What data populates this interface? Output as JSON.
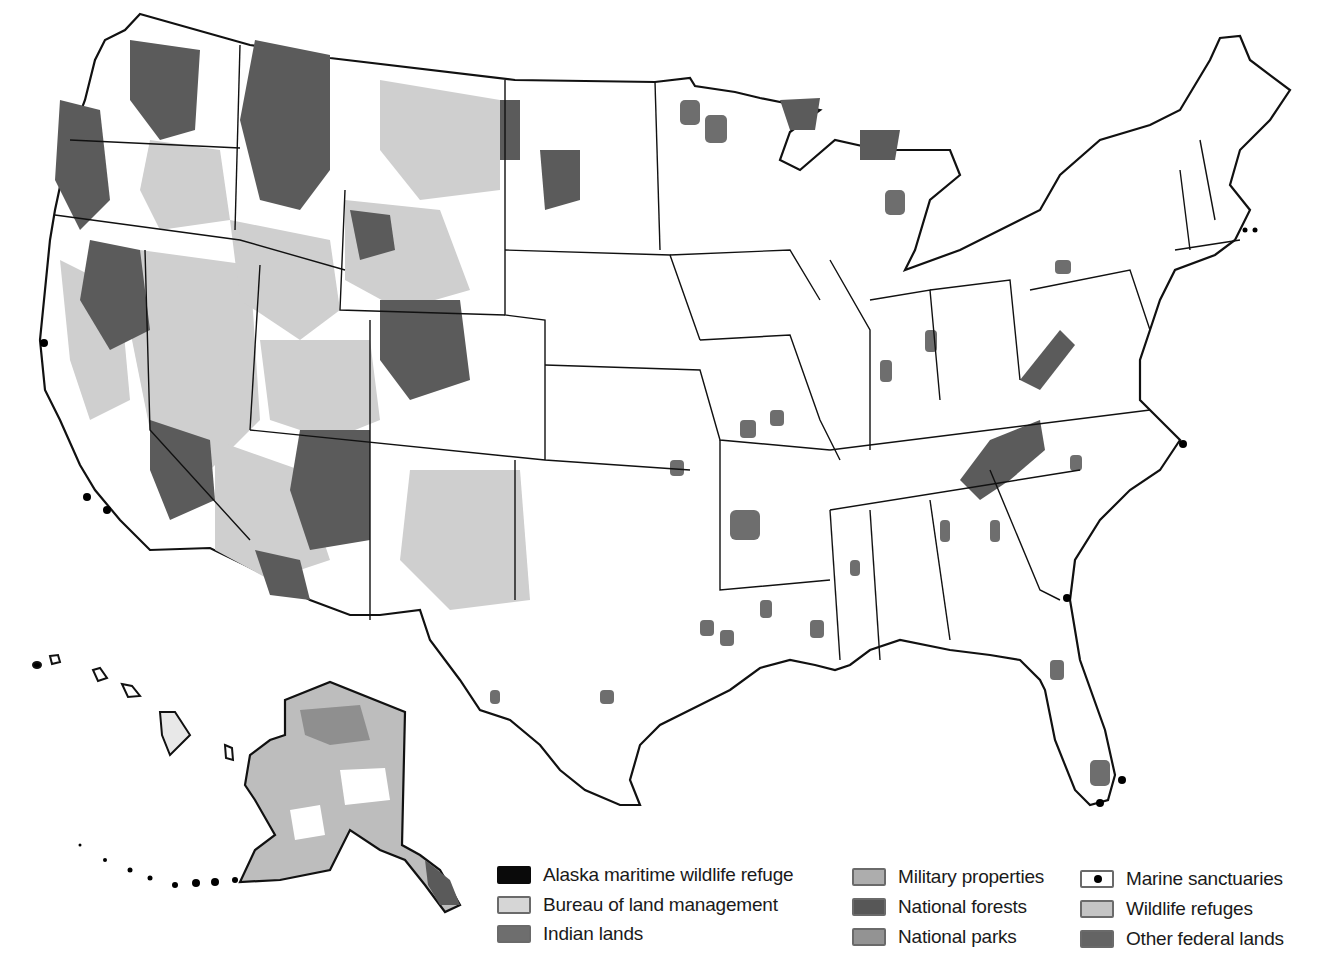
{
  "map": {
    "subject": "Federal lands of the United States",
    "regions_shown": [
      "Contiguous United States",
      "Alaska",
      "Hawaii"
    ],
    "colors": {
      "land_background": "#ffffff",
      "border": "#111111",
      "alaska_maritime_wildlife_refuge": "#0a0a0a",
      "bureau_of_land_management": "#cfcfcf",
      "indian_lands": "#6e6e6e",
      "military_properties": "#a9a9a9",
      "national_forests": "#5a5a5a",
      "national_parks": "#8f8f8f",
      "marine_sanctuaries": "#000000",
      "wildlife_refuges": "#bdbdbd",
      "other_federal_lands": "#666666"
    }
  },
  "legend": {
    "items": [
      {
        "label": "Alaska maritime wildlife refuge",
        "color": "#0a0a0a",
        "icon": "solid-swatch"
      },
      {
        "label": "Bureau of land management",
        "color": "#d6d6d6",
        "icon": "solid-swatch"
      },
      {
        "label": "Indian lands",
        "color": "#6e6e6e",
        "icon": "solid-swatch"
      },
      {
        "label": "Military properties",
        "color": "#adadad",
        "icon": "solid-swatch"
      },
      {
        "label": "National forests",
        "color": "#575757",
        "icon": "solid-swatch"
      },
      {
        "label": "National parks",
        "color": "#939393",
        "icon": "solid-swatch"
      },
      {
        "label": "Marine sanctuaries",
        "color": "#ffffff",
        "icon": "dot-swatch"
      },
      {
        "label": "Wildlife refuges",
        "color": "#c4c4c4",
        "icon": "solid-swatch"
      },
      {
        "label": "Other federal lands",
        "color": "#646464",
        "icon": "solid-swatch"
      }
    ]
  }
}
